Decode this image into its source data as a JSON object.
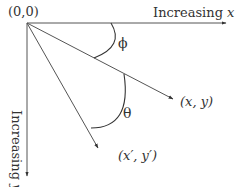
{
  "diagram": {
    "title": "",
    "colors": {
      "line": "#333333",
      "text": "#333333",
      "background": "#ffffff"
    },
    "origin": {
      "label": "(0,0)",
      "x": 27,
      "y": 23
    },
    "x_axis": {
      "label_prefix": "Increasing ",
      "label_var": "x",
      "end": {
        "x": 226,
        "y": 23
      }
    },
    "y_axis": {
      "label_prefix": "Increasing ",
      "label_var": "y",
      "end": {
        "x": 27,
        "y": 176
      }
    },
    "vectors": [
      {
        "name": "v1",
        "label": "(x, y)",
        "end": {
          "x": 173,
          "y": 99
        }
      },
      {
        "name": "v2",
        "label": "(x′, y′)",
        "end": {
          "x": 98,
          "y": 148
        }
      }
    ],
    "angles": [
      {
        "symbol": "ϕ",
        "between": [
          "x-axis",
          "(x, y)"
        ]
      },
      {
        "symbol": "θ",
        "between": [
          "(x, y)",
          "(x′, y′)"
        ]
      }
    ]
  }
}
